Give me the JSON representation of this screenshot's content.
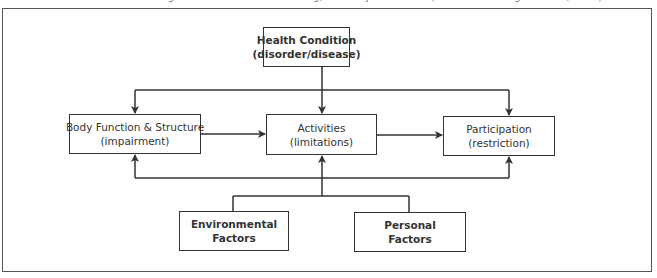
{
  "caption": "Figure: ICF model of functioning, disability and health (World Health Organization, 2001)",
  "diagram": {
    "health_condition": {
      "line1": "Health Condition",
      "line2": "(disorder/disease)"
    },
    "body_function": {
      "line1": "Body Function & Structure",
      "line2": "(impairment)"
    },
    "activities": {
      "line1": "Activities",
      "line2": "(limitations)"
    },
    "participation": {
      "line1": "Participation",
      "line2": "(restriction)"
    },
    "environmental": {
      "line1": "Environmental",
      "line2": "Factors"
    },
    "personal": {
      "line1": "Personal",
      "line2": "Factors"
    }
  },
  "colors": {
    "line": "#333333",
    "frame": "#555555"
  }
}
